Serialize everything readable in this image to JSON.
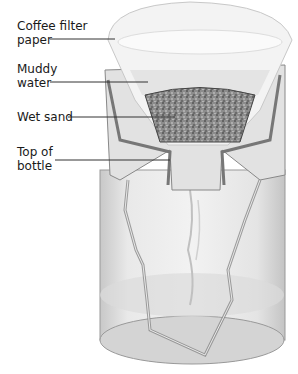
{
  "diagram": {
    "type": "labeled-illustration",
    "labels": [
      {
        "id": "coffee-filter-paper",
        "text": "Coffee filter\npaper"
      },
      {
        "id": "muddy-water",
        "text": "Muddy\nwater"
      },
      {
        "id": "wet-sand",
        "text": "Wet sand"
      },
      {
        "id": "top-of-bottle",
        "text": "Top of\nbottle"
      }
    ],
    "colors": {
      "paper": "#f4f4f4",
      "glass": "#d8d8d8",
      "glass_edge": "#8a8a8a",
      "sand": "#7a7a7a",
      "water": "#e6e6e6",
      "leader_line": "#333333"
    }
  }
}
